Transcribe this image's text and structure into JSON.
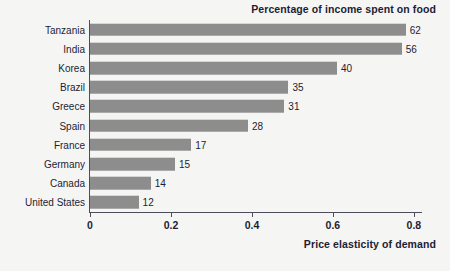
{
  "chart_data": {
    "type": "bar",
    "orientation": "horizontal",
    "title": "Percentage of income spent on food",
    "subtitle": "",
    "xlabel": "Price elasticity of demand",
    "ylabel": "",
    "categories": [
      "Tanzania",
      "India",
      "Korea",
      "Brazil",
      "Greece",
      "Spain",
      "France",
      "Germany",
      "Canada",
      "United States"
    ],
    "values": [
      0.78,
      0.77,
      0.61,
      0.49,
      0.48,
      0.39,
      0.25,
      0.21,
      0.15,
      0.12
    ],
    "data_labels": [
      "62",
      "56",
      "40",
      "35",
      "31",
      "28",
      "17",
      "15",
      "14",
      "12"
    ],
    "data_label_meaning": "Percentage of income spent on food",
    "xlim": [
      0,
      0.82
    ],
    "xticks": [
      0,
      0.2,
      0.4,
      0.6,
      0.8
    ],
    "xtick_labels": [
      "0",
      "0.2",
      "0.4",
      "0.6",
      "0.8"
    ],
    "grid": false,
    "legend": false,
    "legend_position": "none",
    "colors": {
      "bar": "#8d8d8d",
      "axis": "#4c4c5a",
      "text": "#1d1d33",
      "background": "#f5f5f3"
    }
  }
}
